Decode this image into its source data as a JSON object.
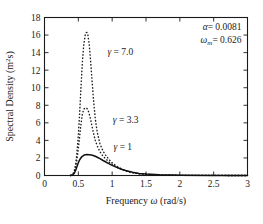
{
  "chart_data": {
    "type": "line",
    "title": "",
    "xlabel": "Frequency ω  (rad/s)",
    "ylabel": "Spectral Density (m²s)",
    "xlim": [
      0,
      3
    ],
    "ylim": [
      0,
      18
    ],
    "xticks": [
      "0",
      "0.5",
      "1",
      "1.5",
      "2",
      "2.5",
      "3"
    ],
    "xtick_values": [
      0,
      0.5,
      1,
      1.5,
      2,
      2.5,
      3
    ],
    "yticks": [
      "0",
      "2",
      "4",
      "6",
      "8",
      "10",
      "12",
      "14",
      "16",
      "18"
    ],
    "ytick_values": [
      0,
      2,
      4,
      6,
      8,
      10,
      12,
      14,
      16,
      18
    ],
    "grid": false,
    "legend_position": "inline-annotations",
    "series": [
      {
        "name": "γ = 7.0",
        "style": "dashed",
        "label_x": 0.93,
        "label_y": 14.1,
        "peak_x": 0.626,
        "peak_y": 16.3,
        "x": [
          0.38,
          0.4,
          0.42,
          0.44,
          0.46,
          0.48,
          0.5,
          0.52,
          0.54,
          0.56,
          0.58,
          0.6,
          0.615,
          0.626,
          0.64,
          0.66,
          0.68,
          0.7,
          0.72,
          0.75,
          0.78,
          0.82,
          0.86,
          0.9,
          0.95,
          1.0,
          1.05,
          1.1,
          1.15,
          1.2,
          1.3,
          1.4,
          1.5,
          1.7,
          2.0,
          2.5,
          3.0
        ],
        "y": [
          0.0,
          0.04,
          0.18,
          0.55,
          1.3,
          2.6,
          4.6,
          7.2,
          10.2,
          12.9,
          14.9,
          15.95,
          16.25,
          16.3,
          16.1,
          15.0,
          13.2,
          11.1,
          9.0,
          6.5,
          4.9,
          3.6,
          2.85,
          2.35,
          1.85,
          1.45,
          1.15,
          0.9,
          0.7,
          0.55,
          0.33,
          0.2,
          0.13,
          0.06,
          0.02,
          0.005,
          0.0
        ]
      },
      {
        "name": "γ = 3.3",
        "style": "dashed",
        "label_x": 1.01,
        "label_y": 6.4,
        "peak_x": 0.626,
        "peak_y": 7.7,
        "x": [
          0.38,
          0.4,
          0.42,
          0.44,
          0.46,
          0.48,
          0.5,
          0.52,
          0.54,
          0.56,
          0.58,
          0.6,
          0.615,
          0.626,
          0.64,
          0.66,
          0.68,
          0.7,
          0.72,
          0.75,
          0.78,
          0.82,
          0.86,
          0.9,
          0.95,
          1.0,
          1.05,
          1.1,
          1.15,
          1.2,
          1.3,
          1.4,
          1.5,
          1.7,
          2.0,
          2.5,
          3.0
        ],
        "y": [
          0.0,
          0.03,
          0.13,
          0.4,
          0.95,
          1.85,
          3.05,
          4.5,
          5.9,
          7.0,
          7.55,
          7.7,
          7.7,
          7.65,
          7.5,
          7.05,
          6.45,
          5.7,
          4.95,
          4.0,
          3.35,
          2.7,
          2.25,
          1.92,
          1.57,
          1.28,
          1.04,
          0.84,
          0.66,
          0.52,
          0.32,
          0.2,
          0.13,
          0.06,
          0.02,
          0.005,
          0.0
        ]
      },
      {
        "name": "γ = 1",
        "style": "solid",
        "label_x": 1.02,
        "label_y": 3.3,
        "peak_x": 0.72,
        "peak_y": 2.38,
        "x": [
          0.38,
          0.4,
          0.42,
          0.44,
          0.46,
          0.48,
          0.5,
          0.52,
          0.55,
          0.58,
          0.6,
          0.63,
          0.66,
          0.69,
          0.72,
          0.75,
          0.78,
          0.82,
          0.86,
          0.9,
          0.95,
          1.0,
          1.05,
          1.1,
          1.15,
          1.2,
          1.3,
          1.4,
          1.5,
          1.7,
          2.0,
          2.5,
          3.0
        ],
        "y": [
          0.0,
          0.02,
          0.09,
          0.26,
          0.58,
          1.02,
          1.46,
          1.8,
          2.13,
          2.3,
          2.36,
          2.38,
          2.37,
          2.34,
          2.28,
          2.19,
          2.08,
          1.92,
          1.74,
          1.57,
          1.36,
          1.16,
          0.98,
          0.82,
          0.68,
          0.56,
          0.37,
          0.24,
          0.16,
          0.075,
          0.025,
          0.005,
          0.0
        ]
      }
    ],
    "annotations": [
      {
        "symbol": "α",
        "subscript": "",
        "equals": "= 0.0081",
        "value": "0.0081"
      },
      {
        "symbol": "ω",
        "subscript": "m",
        "equals": "= 0.626",
        "value": "0.626"
      }
    ]
  }
}
